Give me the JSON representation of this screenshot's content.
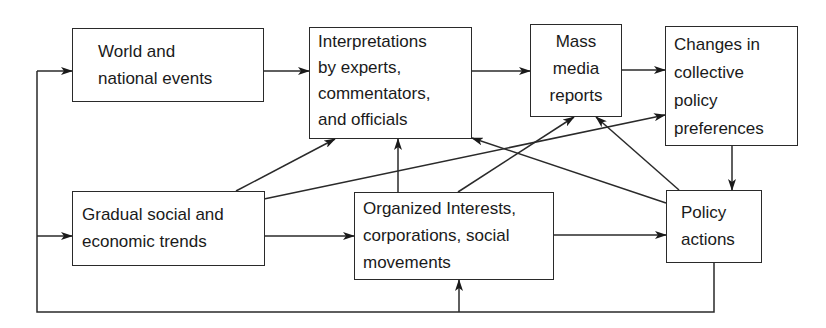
{
  "diagram": {
    "nodes": [
      {
        "id": "world",
        "lines": [
          "World and",
          "national events"
        ]
      },
      {
        "id": "interp",
        "lines": [
          "Interpretations",
          "by experts,",
          "commentators,",
          "and officials"
        ]
      },
      {
        "id": "mass",
        "lines": [
          "Mass",
          "media",
          "reports"
        ]
      },
      {
        "id": "changes",
        "lines": [
          "Changes in",
          "collective",
          "policy",
          "preferences"
        ]
      },
      {
        "id": "gradual",
        "lines": [
          "Gradual social and",
          "economic trends"
        ]
      },
      {
        "id": "organized",
        "lines": [
          "Organized Interests,",
          "corporations, social",
          "movements"
        ]
      },
      {
        "id": "policy",
        "lines": [
          "Policy",
          "actions"
        ]
      }
    ],
    "edges": [
      {
        "from": "world",
        "to": "interp"
      },
      {
        "from": "interp",
        "to": "mass"
      },
      {
        "from": "mass",
        "to": "changes"
      },
      {
        "from": "changes",
        "to": "policy"
      },
      {
        "from": "gradual",
        "to": "interp"
      },
      {
        "from": "gradual",
        "to": "changes"
      },
      {
        "from": "gradual",
        "to": "organized"
      },
      {
        "from": "organized",
        "to": "interp"
      },
      {
        "from": "organized",
        "to": "mass"
      },
      {
        "from": "organized",
        "to": "policy"
      },
      {
        "from": "policy",
        "to": "interp"
      },
      {
        "from": "policy",
        "to": "mass"
      },
      {
        "from": "policy",
        "to": "world",
        "via": "feedback-loop"
      },
      {
        "from": "policy",
        "to": "gradual",
        "via": "feedback-loop"
      },
      {
        "from": "policy",
        "to": "organized",
        "via": "feedback-loop"
      }
    ]
  }
}
